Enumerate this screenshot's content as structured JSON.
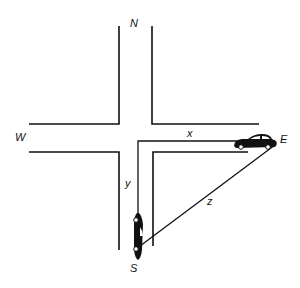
{
  "diagram": {
    "title": "",
    "compass": {
      "north": "N",
      "south": "S",
      "east": "E",
      "west": "W"
    },
    "segments": {
      "x": "x",
      "y": "y",
      "z": "z"
    },
    "colors": {
      "ink": "#111111",
      "background": "#ffffff"
    }
  }
}
